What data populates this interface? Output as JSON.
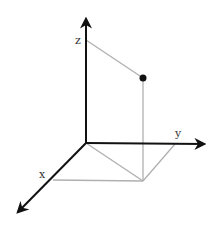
{
  "diagram": {
    "type": "3d-coordinate-system",
    "axes": {
      "x": {
        "label": "x"
      },
      "y": {
        "label": "y"
      },
      "z": {
        "label": "z"
      }
    },
    "point": {
      "marker": "filled-dot"
    },
    "colors": {
      "axis": "#111111",
      "projection": "#b0b0b0",
      "point": "#111111"
    }
  }
}
